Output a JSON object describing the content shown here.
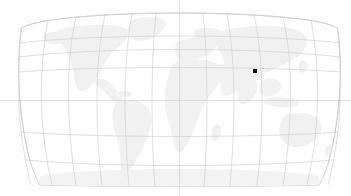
{
  "figure": {
    "type": "map",
    "title": "",
    "background_color": "#ffffff",
    "width": 351,
    "height": 196
  },
  "map": {
    "projection": "robinson",
    "land_color": "#f1f1f1",
    "ocean_color": "#ffffff",
    "outline_color": "#bdbdbd",
    "graticule_color": "#c9c9c9",
    "graticule": {
      "meridian_interval_deg": 30,
      "parallel_interval_deg": 30,
      "meridians_deg": [
        -180,
        -150,
        -120,
        -90,
        -60,
        -30,
        0,
        30,
        60,
        90,
        120,
        150,
        180
      ],
      "parallels_deg": [
        -60,
        -30,
        0,
        30,
        60
      ]
    },
    "axis_lines": {
      "central_meridian_deg": 0,
      "equator_deg": 0,
      "extends_beyond_frame": true,
      "color": "#cfcfcf"
    },
    "bounds_px": {
      "left": 28,
      "right": 338,
      "top": 13,
      "bottom": 186
    },
    "continents": [
      "North America",
      "South America",
      "Europe",
      "Africa",
      "Asia",
      "Australia",
      "Antarctica",
      "Greenland"
    ]
  },
  "markers": [
    {
      "name": "location-marker",
      "label": "",
      "color": "#000000",
      "shape": "square",
      "size_px": 4,
      "x_px": 255,
      "y_px": 71,
      "approx_lon_deg": 98,
      "approx_lat_deg": 37
    }
  ],
  "legend": {
    "visible": false,
    "entries": []
  },
  "labels": {
    "visible": false,
    "items": []
  }
}
